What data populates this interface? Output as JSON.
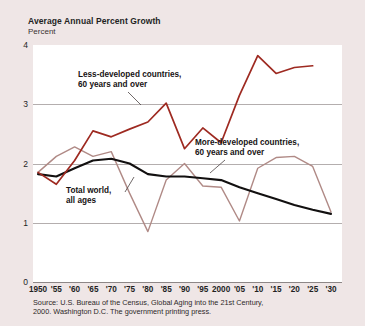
{
  "chart_data": {
    "type": "line",
    "title": "Average Annual Percent Growth",
    "subtitle": "Percent",
    "ylabel": "Percent",
    "xlabel": "",
    "ylim": [
      0,
      4
    ],
    "yticks": [
      "0",
      "1",
      "2",
      "3",
      "4"
    ],
    "grid": true,
    "legend_position": "inline-annotations",
    "x": [
      1950,
      1955,
      1960,
      1965,
      1970,
      1975,
      1980,
      1985,
      1990,
      1995,
      2000,
      2005,
      2010,
      2015,
      2020,
      2025,
      2030
    ],
    "xtick_labels": [
      "1950",
      "'55",
      "'60",
      "'65",
      "'70",
      "'75",
      "'80",
      "'85",
      "'90",
      "'95",
      "2000",
      "'05",
      "'10",
      "'15",
      "'20",
      "'25",
      "'30"
    ],
    "series": [
      {
        "name": "Less-developed countries, 60 years and over",
        "color": "#9e2a21",
        "values": [
          1.85,
          1.65,
          2.05,
          2.55,
          2.45,
          2.58,
          2.7,
          3.02,
          2.25,
          2.6,
          2.35,
          3.15,
          3.82,
          3.52,
          3.62,
          3.65,
          null
        ]
      },
      {
        "name": "More-developed countries, 60 years and over",
        "color": "#b08a86",
        "values": [
          1.85,
          2.12,
          2.28,
          2.12,
          2.2,
          1.5,
          0.85,
          1.72,
          2.0,
          1.62,
          1.6,
          1.03,
          1.92,
          2.1,
          2.12,
          1.95,
          1.18
        ]
      },
      {
        "name": "Total world, all ages",
        "color": "#121010",
        "values": [
          1.82,
          1.78,
          1.92,
          2.05,
          2.08,
          2.0,
          1.82,
          1.78,
          1.78,
          1.75,
          1.72,
          1.6,
          1.5,
          1.4,
          1.3,
          1.22,
          1.15
        ]
      }
    ],
    "annotations": [
      {
        "text_line1": "Less-developed countries,",
        "text_line2": "60 years and over"
      },
      {
        "text_line1": "More-developed countries,",
        "text_line2": "60 years and over"
      },
      {
        "text_line1": "Total world,",
        "text_line2": "all ages"
      }
    ],
    "source_line1": "Source: U.S. Bureau of the Census, Global Aging into the 21st Century,",
    "source_line2": "2000. Washington D.C. The government printing press."
  }
}
